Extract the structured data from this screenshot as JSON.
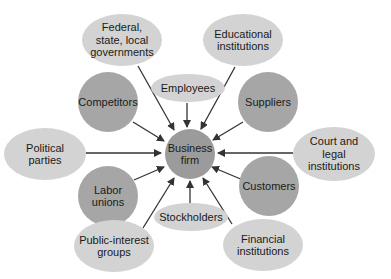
{
  "diagram": {
    "center": {
      "label": "Business\nfirm"
    },
    "nodes": [
      {
        "id": "federal",
        "label": "Federal,\nstate, local\ngovernments",
        "shade": "light"
      },
      {
        "id": "educational",
        "label": "Educational\ninstitutions",
        "shade": "light"
      },
      {
        "id": "employees",
        "label": "Employees",
        "shade": "light"
      },
      {
        "id": "competitors",
        "label": "Competitors",
        "shade": "dark"
      },
      {
        "id": "suppliers",
        "label": "Suppliers",
        "shade": "dark"
      },
      {
        "id": "political",
        "label": "Political\nparties",
        "shade": "light"
      },
      {
        "id": "court",
        "label": "Court and\nlegal\ninstitutions",
        "shade": "light"
      },
      {
        "id": "labor",
        "label": "Labor\nunions",
        "shade": "dark"
      },
      {
        "id": "customers",
        "label": "Customers",
        "shade": "dark"
      },
      {
        "id": "stockholders",
        "label": "Stockholders",
        "shade": "light"
      },
      {
        "id": "public",
        "label": "Public-interest\ngroups",
        "shade": "light"
      },
      {
        "id": "financial",
        "label": "Financial\ninstitutions",
        "shade": "light"
      }
    ],
    "colors": {
      "light": "#d3d3d3",
      "dark": "#a6a6a6",
      "center": "#9b9b9b",
      "arrow": "#333333"
    }
  }
}
